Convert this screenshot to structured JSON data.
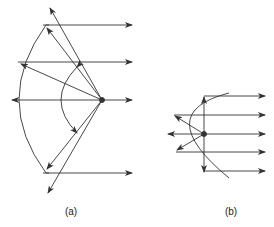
{
  "figure": {
    "panel_a": {
      "label": "(a)",
      "description": "Spherical reflector with point source at focus; rays reflected partly parallel, edge rays spill over"
    },
    "panel_b": {
      "label": "(b)",
      "description": "Parabolic reflector with point source at focus; reflected rays parallel"
    }
  },
  "colors": {
    "stroke": "#333333",
    "background": "#ffffff"
  }
}
